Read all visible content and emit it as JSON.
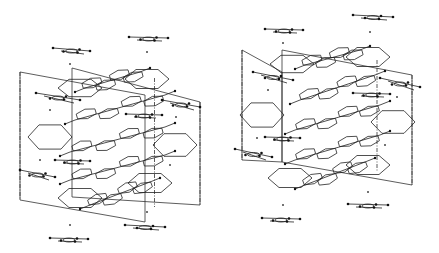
{
  "figure": {
    "type": "crystal-packing-stereo-pair",
    "background": "#ffffff",
    "ink": "#222222",
    "panels": [
      {
        "name": "left-view",
        "offset": [
          0,
          0
        ],
        "cell": {
          "front": [
            [
              20,
              72
            ],
            [
              145,
              95
            ],
            [
              145,
              222
            ],
            [
              20,
              200
            ]
          ],
          "back_dx": 52,
          "back_dy": -4,
          "back": [
            [
              72,
              68
            ],
            [
              200,
              102
            ],
            [
              200,
              205
            ],
            [
              72,
              197
            ]
          ]
        },
        "hex_rings": [
          {
            "cx": 80,
            "cy": 88,
            "rx": 22,
            "ry": 10
          },
          {
            "cx": 147,
            "cy": 79,
            "rx": 22,
            "ry": 11
          },
          {
            "cx": 50,
            "cy": 137,
            "rx": 22,
            "ry": 14
          },
          {
            "cx": 175,
            "cy": 145,
            "rx": 22,
            "ry": 13
          },
          {
            "cx": 80,
            "cy": 198,
            "rx": 22,
            "ry": 11
          },
          {
            "cx": 150,
            "cy": 183,
            "rx": 22,
            "ry": 11
          }
        ],
        "stacked_molecules": [
          {
            "x1": 75,
            "y1": 120,
            "x2": 165,
            "y2": 95
          },
          {
            "x1": 70,
            "y1": 152,
            "x2": 165,
            "y2": 127
          },
          {
            "x1": 70,
            "y1": 180,
            "x2": 165,
            "y2": 155
          },
          {
            "x1": 90,
            "y1": 205,
            "x2": 150,
            "y2": 182
          },
          {
            "x1": 85,
            "y1": 88,
            "x2": 140,
            "y2": 72
          }
        ],
        "linear_molecules": [
          {
            "x1": 53,
            "y1": 48,
            "x2": 90,
            "y2": 51
          },
          {
            "x1": 129,
            "y1": 37,
            "x2": 168,
            "y2": 38
          },
          {
            "x1": 36,
            "y1": 93,
            "x2": 80,
            "y2": 100
          },
          {
            "x1": 162,
            "y1": 100,
            "x2": 200,
            "y2": 107
          },
          {
            "x1": 20,
            "y1": 170,
            "x2": 55,
            "y2": 177
          },
          {
            "x1": 125,
            "y1": 225,
            "x2": 165,
            "y2": 227
          },
          {
            "x1": 50,
            "y1": 238,
            "x2": 88,
            "y2": 239
          },
          {
            "x1": 126,
            "y1": 114,
            "x2": 162,
            "y2": 115
          },
          {
            "x1": 55,
            "y1": 160,
            "x2": 90,
            "y2": 161
          }
        ],
        "dots": [
          [
            70,
            64
          ],
          [
            147,
            52
          ],
          [
            50,
            110
          ],
          [
            176,
            117
          ],
          [
            40,
            160
          ],
          [
            170,
            165
          ],
          [
            147,
            212
          ],
          [
            70,
            225
          ]
        ]
      },
      {
        "name": "right-view",
        "offset": [
          0,
          0
        ],
        "cell": {
          "front": [
            [
              242,
              50
            ],
            [
              282,
              72
            ],
            [
              282,
              162
            ],
            [
              242,
              160
            ]
          ],
          "back": [
            [
              282,
              50
            ],
            [
              412,
              75
            ],
            [
              412,
              185
            ],
            [
              282,
              162
            ]
          ]
        },
        "hex_rings": [
          {
            "cx": 292,
            "cy": 64,
            "rx": 22,
            "ry": 10
          },
          {
            "cx": 368,
            "cy": 57,
            "rx": 22,
            "ry": 11
          },
          {
            "cx": 262,
            "cy": 115,
            "rx": 22,
            "ry": 14
          },
          {
            "cx": 393,
            "cy": 122,
            "rx": 22,
            "ry": 13
          },
          {
            "cx": 290,
            "cy": 178,
            "rx": 22,
            "ry": 11
          },
          {
            "cx": 368,
            "cy": 165,
            "rx": 22,
            "ry": 11
          }
        ],
        "stacked_molecules": [
          {
            "x1": 300,
            "y1": 100,
            "x2": 375,
            "y2": 75
          },
          {
            "x1": 295,
            "y1": 130,
            "x2": 380,
            "y2": 105
          },
          {
            "x1": 295,
            "y1": 160,
            "x2": 380,
            "y2": 135
          },
          {
            "x1": 305,
            "y1": 185,
            "x2": 365,
            "y2": 162
          },
          {
            "x1": 305,
            "y1": 65,
            "x2": 360,
            "y2": 50
          }
        ],
        "linear_molecules": [
          {
            "x1": 265,
            "y1": 29,
            "x2": 303,
            "y2": 30
          },
          {
            "x1": 353,
            "y1": 15,
            "x2": 393,
            "y2": 17
          },
          {
            "x1": 253,
            "y1": 72,
            "x2": 293,
            "y2": 80
          },
          {
            "x1": 380,
            "y1": 78,
            "x2": 420,
            "y2": 87
          },
          {
            "x1": 235,
            "y1": 149,
            "x2": 272,
            "y2": 157
          },
          {
            "x1": 348,
            "y1": 204,
            "x2": 388,
            "y2": 205
          },
          {
            "x1": 262,
            "y1": 218,
            "x2": 300,
            "y2": 219
          },
          {
            "x1": 353,
            "y1": 93,
            "x2": 390,
            "y2": 94
          },
          {
            "x1": 265,
            "y1": 137,
            "x2": 300,
            "y2": 138
          }
        ],
        "dots": [
          [
            283,
            43
          ],
          [
            370,
            32
          ],
          [
            268,
            90
          ],
          [
            397,
            97
          ],
          [
            257,
            138
          ],
          [
            385,
            145
          ],
          [
            368,
            192
          ],
          [
            283,
            205
          ]
        ]
      }
    ]
  }
}
